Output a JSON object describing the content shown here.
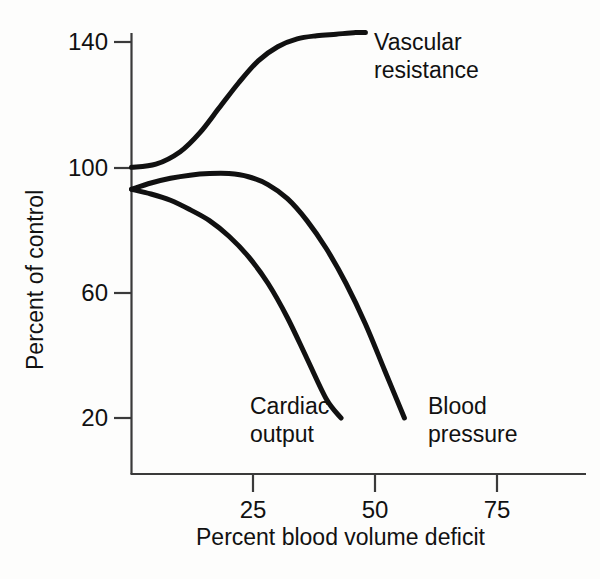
{
  "chart_data": {
    "type": "line",
    "title": "",
    "subtitle": "",
    "xlabel": "Percent blood volume deficit",
    "ylabel": "Percent of control",
    "xlim": [
      0,
      93
    ],
    "ylim": [
      7,
      147
    ],
    "xticks": [
      25,
      50,
      75
    ],
    "yticks": [
      140,
      100,
      60,
      20
    ],
    "xtick_labels": [
      "25",
      "50",
      "75"
    ],
    "ytick_labels": [
      "140",
      "100",
      "60",
      "20"
    ],
    "grid": false,
    "legend": "inline-annotations",
    "series": [
      {
        "name": "Vascular resistance",
        "label_text": "Vascular\nresistance",
        "color": "#111111",
        "x": [
          0,
          5,
          10,
          14,
          18,
          22,
          26,
          30,
          34,
          38,
          42,
          46,
          48
        ],
        "y": [
          100,
          101,
          105,
          111,
          119,
          127,
          134,
          138.5,
          141,
          142,
          142.5,
          143,
          143
        ]
      },
      {
        "name": "Blood pressure",
        "label_text": "Blood\npressure",
        "color": "#111111",
        "x": [
          0,
          4,
          8,
          12,
          16,
          20,
          24,
          28,
          32,
          36,
          40,
          44,
          48,
          52,
          56
        ],
        "y": [
          93,
          95,
          96.5,
          97.5,
          98,
          98,
          97,
          94.5,
          90,
          83,
          74,
          63,
          50,
          35,
          20
        ]
      },
      {
        "name": "Cardiac output",
        "label_text": "Cardiac\noutput",
        "color": "#111111",
        "x": [
          0,
          4,
          8,
          12,
          16,
          20,
          24,
          28,
          32,
          36,
          40,
          43
        ],
        "y": [
          93,
          91.5,
          89.5,
          86.5,
          83,
          78,
          71.5,
          63,
          52,
          39,
          26,
          20
        ]
      }
    ]
  },
  "axes": {
    "y_title": "Percent of control",
    "x_title": "Percent blood volume deficit",
    "ytick_labels": [
      "140",
      "100",
      "60",
      "20"
    ],
    "xtick_labels": [
      "25",
      "50",
      "75"
    ]
  },
  "annotations": {
    "vascular_resistance": "Vascular\nresistance",
    "cardiac_output": "Cardiac\noutput",
    "blood_pressure": "Blood\npressure"
  },
  "colors": {
    "curve": "#111111",
    "axis": "#3a3a3a",
    "background": "#fdfdfc",
    "text": "#111111"
  }
}
